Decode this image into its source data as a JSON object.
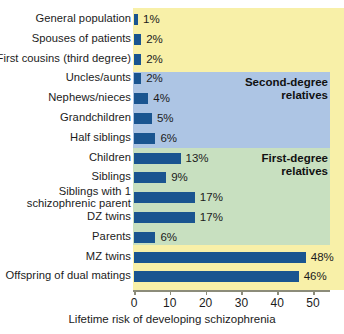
{
  "chart_data": {
    "type": "bar",
    "orientation": "horizontal",
    "title": "",
    "subtitle": "",
    "xlabel": "Lifetime risk of developing schizophrenia",
    "ylabel": "",
    "xlim": [
      0,
      55
    ],
    "xticks": [
      0,
      10,
      20,
      30,
      40,
      50
    ],
    "xtick_labels": [
      "0",
      "10",
      "20",
      "30",
      "40",
      "50"
    ],
    "grid": false,
    "legend_position": "inside-right",
    "value_suffix": "%",
    "categories": [
      "General population",
      "Spouses of patients",
      "First cousins (third degree)",
      "Uncles/aunts",
      "Nephews/nieces",
      "Grandchildren",
      "Half siblings",
      "Children",
      "Siblings",
      "Siblings with 1 schizophrenic parent",
      "DZ twins",
      "Parents",
      "MZ twins",
      "Offspring of dual matings"
    ],
    "values": [
      1,
      2,
      2,
      2,
      4,
      5,
      6,
      13,
      9,
      17,
      17,
      6,
      48,
      46
    ],
    "value_labels": [
      "1%",
      "2%",
      "2%",
      "2%",
      "4%",
      "5%",
      "6%",
      "13%",
      "9%",
      "17%",
      "17%",
      "6%",
      "48%",
      "46%"
    ],
    "bar_color": "#1a5590",
    "groups": [
      {
        "label_line1": "Second-degree",
        "label_line2": "relatives",
        "band_color": "#adc5e4"
      },
      {
        "label_line1": "First-degree",
        "label_line2": "relatives",
        "band_color": "#c8e0c0"
      }
    ],
    "background_color": "#f8f0a8",
    "axis_color": "#8c8c7a"
  },
  "rows": [
    {
      "label": "General population",
      "label2": "",
      "value_label": "1%"
    },
    {
      "label": "Spouses of patients",
      "label2": "",
      "value_label": "2%"
    },
    {
      "label": "First cousins (third degree)",
      "label2": "",
      "value_label": "2%"
    },
    {
      "label": "Uncles/aunts",
      "label2": "",
      "value_label": "2%"
    },
    {
      "label": "Nephews/nieces",
      "label2": "",
      "value_label": "4%"
    },
    {
      "label": "Grandchildren",
      "label2": "",
      "value_label": "5%"
    },
    {
      "label": "Half siblings",
      "label2": "",
      "value_label": "6%"
    },
    {
      "label": "Children",
      "label2": "",
      "value_label": "13%"
    },
    {
      "label": "Siblings",
      "label2": "",
      "value_label": "9%"
    },
    {
      "label": "Siblings with 1",
      "label2": "schizophrenic parent",
      "value_label": "17%"
    },
    {
      "label": "DZ twins",
      "label2": "",
      "value_label": "17%"
    },
    {
      "label": "Parents",
      "label2": "",
      "value_label": "6%"
    },
    {
      "label": "MZ twins",
      "label2": "",
      "value_label": "48%"
    },
    {
      "label": "Offspring of dual matings",
      "label2": "",
      "value_label": "46%"
    }
  ],
  "axis": {
    "ticks": [
      {
        "label": "0"
      },
      {
        "label": "10"
      },
      {
        "label": "20"
      },
      {
        "label": "30"
      },
      {
        "label": "40"
      },
      {
        "label": "50"
      }
    ],
    "title": "Lifetime risk of developing schizophrenia"
  },
  "legends": {
    "second_degree": {
      "line1": "Second-degree",
      "line2": "relatives"
    },
    "first_degree": {
      "line1": "First-degree",
      "line2": "relatives"
    }
  }
}
